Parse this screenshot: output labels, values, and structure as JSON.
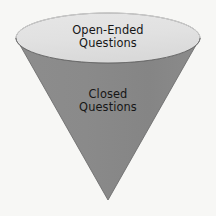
{
  "diagram": {
    "type": "inverted-cone-funnel",
    "title_visible": false,
    "canvas": {
      "width": 216,
      "height": 216,
      "background_color": "#f7f7f5"
    },
    "colors": {
      "cone_body": "#8a8a8a",
      "cone_top_face": "#e2e2e2",
      "outline": "#5e5e5e",
      "rim_highlight": "#f2f2f2",
      "text": "#161616"
    },
    "geometry": {
      "ellipse_center_x": 108,
      "ellipse_center_y": 38,
      "ellipse_radius_x": 92,
      "ellipse_radius_y": 25,
      "apex_x": 108,
      "apex_y": 200
    },
    "sections": [
      {
        "id": "open-ended",
        "region": "top-ellipse-face",
        "fill_color": "#e2e2e2",
        "label_lines": [
          "Open-Ended",
          "Questions"
        ],
        "label_text": "Open-Ended Questions"
      },
      {
        "id": "closed",
        "region": "cone-body",
        "fill_color": "#8a8a8a",
        "label_lines": [
          "Closed",
          "Questions"
        ],
        "label_text": "Closed Questions"
      }
    ]
  },
  "labels": {
    "open_line1": "Open-Ended",
    "open_line2": "Questions",
    "closed_line1": "Closed",
    "closed_line2": "Questions"
  }
}
